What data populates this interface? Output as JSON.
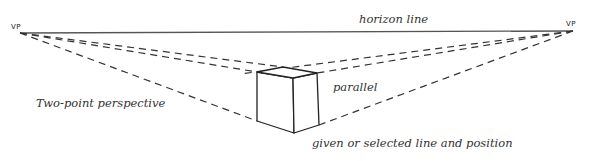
{
  "diagram": {
    "type": "two-point perspective illustration",
    "labels": {
      "vp_left": "VP",
      "vp_right": "VP",
      "horizon_line": "horizon line",
      "title": "Two-point perspective",
      "parallel": "parallel",
      "given_line": "given or selected line and position"
    },
    "points": {
      "vp_left": [
        20,
        33
      ],
      "vp_right": [
        573,
        31
      ],
      "box_top_left": [
        257,
        72
      ],
      "box_top_back": [
        283,
        67
      ],
      "box_top_front": [
        293,
        78
      ],
      "box_top_right": [
        317,
        73
      ],
      "box_bottom_left": [
        257,
        121
      ],
      "box_bottom_front": [
        294,
        133
      ],
      "box_bottom_right": [
        319,
        125
      ]
    },
    "colors": {
      "ink": "#222222",
      "horizon": "#555555",
      "background": "#ffffff"
    }
  }
}
